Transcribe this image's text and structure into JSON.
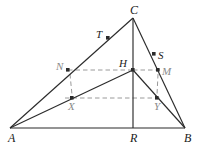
{
  "figure": {
    "type": "geometry-diagram",
    "width": 197,
    "height": 147,
    "background": "#ffffff",
    "stroke_dark": "#2b2b2b",
    "stroke_gray": "#9a9a9a",
    "label_dark": "#1a1a1a",
    "label_gray": "#8a8a8a"
  },
  "points": {
    "A": {
      "label": "A",
      "x": 10,
      "y": 128,
      "dot": false,
      "label_dx": -2,
      "label_dy": 4,
      "tone": "dark",
      "size": "big"
    },
    "B": {
      "label": "B",
      "x": 185,
      "y": 128,
      "dot": false,
      "label_dx": -1,
      "label_dy": 4,
      "tone": "dark",
      "size": "big"
    },
    "C": {
      "label": "C",
      "x": 133,
      "y": 18,
      "dot": false,
      "label_dx": -3,
      "label_dy": -14,
      "tone": "dark",
      "size": "big"
    },
    "R": {
      "label": "R",
      "x": 133,
      "y": 128,
      "dot": false,
      "label_dx": -3,
      "label_dy": 4,
      "tone": "dark",
      "size": "big"
    },
    "H": {
      "label": "H",
      "x": 133,
      "y": 70,
      "dot": true,
      "label_dx": -14,
      "label_dy": -12,
      "tone": "dark",
      "size": "norm"
    },
    "N": {
      "label": "N",
      "x": 68,
      "y": 70,
      "dot": true,
      "label_dx": -12,
      "label_dy": -9,
      "tone": "gray",
      "size": "norm"
    },
    "M": {
      "label": "M",
      "x": 158,
      "y": 70,
      "dot": true,
      "label_dx": 4,
      "label_dy": -4,
      "tone": "gray",
      "size": "norm"
    },
    "X": {
      "label": "X",
      "x": 72,
      "y": 98,
      "dot": true,
      "label_dx": -4,
      "label_dy": 3,
      "tone": "gray",
      "size": "norm"
    },
    "Y": {
      "label": "Y",
      "x": 157,
      "y": 98,
      "dot": true,
      "label_dx": -3,
      "label_dy": 3,
      "tone": "gray",
      "size": "norm"
    },
    "T": {
      "label": "T",
      "x": 108,
      "y": 38,
      "dot": true,
      "label_dx": -12,
      "label_dy": -9,
      "tone": "dark",
      "size": "norm"
    },
    "S": {
      "label": "S",
      "x": 154,
      "y": 54,
      "dot": true,
      "label_dx": 4,
      "label_dy": -4,
      "tone": "dark",
      "size": "norm"
    }
  },
  "solid_segments": [
    {
      "name": "side-AB",
      "x1": 10,
      "y1": 128,
      "x2": 185,
      "y2": 128
    },
    {
      "name": "side-AC",
      "x1": 10,
      "y1": 128,
      "x2": 133,
      "y2": 18
    },
    {
      "name": "side-BC",
      "x1": 185,
      "y1": 128,
      "x2": 133,
      "y2": 18
    },
    {
      "name": "altitude-CR",
      "x1": 133,
      "y1": 18,
      "x2": 133,
      "y2": 128
    },
    {
      "name": "cevian-AH",
      "x1": 10,
      "y1": 128,
      "x2": 133,
      "y2": 70
    },
    {
      "name": "cevian-BH",
      "x1": 185,
      "y1": 128,
      "x2": 133,
      "y2": 70
    }
  ],
  "dashed_segments": [
    {
      "name": "dashed-N-H",
      "x1": 68,
      "y1": 70,
      "x2": 133,
      "y2": 70
    },
    {
      "name": "dashed-H-M",
      "x1": 133,
      "y1": 70,
      "x2": 160,
      "y2": 70
    },
    {
      "name": "dashed-X-Y",
      "x1": 65,
      "y1": 98,
      "x2": 160,
      "y2": 98
    },
    {
      "name": "dashed-N-X",
      "x1": 70,
      "y1": 74,
      "x2": 72,
      "y2": 95
    },
    {
      "name": "dashed-M-Y",
      "x1": 158,
      "y1": 74,
      "x2": 157,
      "y2": 95
    }
  ]
}
